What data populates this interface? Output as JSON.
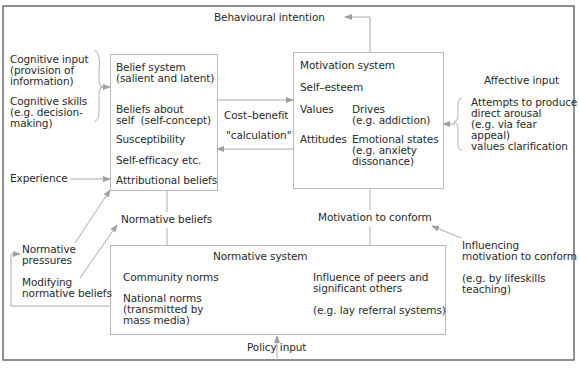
{
  "diagram": {
    "top": {
      "behavioural_intention": "Behavioural intention"
    },
    "left_inputs": {
      "cognitive_input": "Cognitive input\n(provision of\ninformation)",
      "cognitive_skills": "Cognitive skills\n(e.g. decision-\nmaking)",
      "experience": "Experience",
      "normative_pressures": "Normative\npressures",
      "modifying_normative_beliefs": "Modifying\nnormative beliefs"
    },
    "belief_system": {
      "title": "Belief system\n(salient and latent)",
      "items": [
        "Beliefs about\nself  (self-concept)",
        "Susceptibility",
        "Self-efficacy etc.",
        "Attributional beliefs"
      ]
    },
    "cost_benefit": {
      "line1": "Cost–benefit",
      "line2": "\"calculation\""
    },
    "motivation_system": {
      "title": "Motivation system",
      "self_esteem": "Self–esteem",
      "values": "Values",
      "drives": "Drives\n(e.g. addiction)",
      "attitudes": "Attitudes",
      "emotional_states": "Emotional states\n(e.g. anxiety\ndissonance)"
    },
    "affective_input": {
      "title": "Affective input",
      "body": "Attempts to produce\ndirect arousal\n(e.g. via fear\nappeal)\nvalues clarification"
    },
    "normative_beliefs": "Normative beliefs",
    "motivation_to_conform": "Motivation to conform",
    "influencing": {
      "title": "Influencing\nmotivation to conform",
      "example": "(e.g. by lifeskills\nteaching)"
    },
    "normative_system": {
      "title": "Normative system",
      "community_norms": "Community norms",
      "national_norms": "National norms\n(transmitted by\nmass media)",
      "influence_peers": "Influence of peers and\nsignificant others",
      "lay_referral": "(e.g. lay referral systems)"
    },
    "policy_input": "Policy input",
    "colors": {
      "border": "#555555",
      "box_border": "#b8b8b8",
      "arrow": "#a0a0a0",
      "text": "#2a2a2a"
    }
  }
}
